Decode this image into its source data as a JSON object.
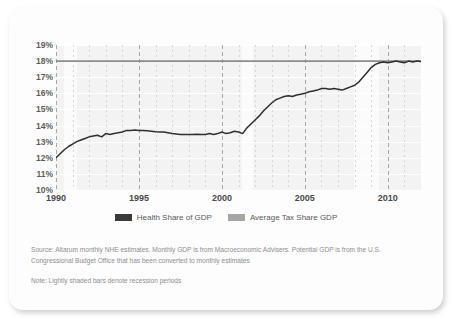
{
  "card": {
    "background": "#fdfdfd"
  },
  "legend": {
    "position": "bottom-center",
    "entries": [
      {
        "label": "Health Share of GDP",
        "color": "#3a3a3a"
      },
      {
        "label": "Average Tax Share GDP",
        "color": "#a6a6a6"
      }
    ]
  },
  "footnotes": {
    "source": "Source: Altarum monthly NHE estimates. Monthly GDP is from Macroeconomic Advisers. Potential GDP is from the U.S. Congressional Budget Office that has been converted to monthly estimates",
    "note": "Note: Lightly shaded bars denote recession periods"
  },
  "chart_data": {
    "type": "line",
    "title": "",
    "xlabel": "",
    "ylabel": "",
    "xlim": [
      1990,
      2012
    ],
    "ylim": [
      10,
      19
    ],
    "grid": true,
    "ytick_labels": [
      "19%",
      "18%",
      "17%",
      "16%",
      "15%",
      "14%",
      "13%",
      "12%",
      "11%",
      "10%"
    ],
    "ytick_values": [
      19,
      18,
      17,
      16,
      15,
      14,
      13,
      12,
      11,
      10
    ],
    "xtick_labels": [
      "1990",
      "1995",
      "2000",
      "2005",
      "2010"
    ],
    "xtick_values": [
      1990,
      1995,
      2000,
      2005,
      2010
    ],
    "annotations": [
      {
        "kind": "recession-band",
        "label": "recession period",
        "x_start": 1990.5,
        "x_end": 1991.25
      },
      {
        "kind": "recession-band",
        "label": "recession period",
        "x_start": 2001.2,
        "x_end": 2001.9
      },
      {
        "kind": "recession-band",
        "label": "recession period",
        "x_start": 2007.95,
        "x_end": 2009.45
      }
    ],
    "series": [
      {
        "name": "Health Share of GDP",
        "color": "#2f2f2f",
        "x": [
          1990.0,
          1990.25,
          1990.5,
          1990.75,
          1991.0,
          1991.25,
          1991.5,
          1991.75,
          1992.0,
          1992.25,
          1992.5,
          1992.75,
          1993.0,
          1993.25,
          1993.5,
          1993.75,
          1994.0,
          1994.25,
          1994.5,
          1994.75,
          1995.0,
          1995.25,
          1995.5,
          1995.75,
          1996.0,
          1996.25,
          1996.5,
          1996.75,
          1997.0,
          1997.25,
          1997.5,
          1997.75,
          1998.0,
          1998.25,
          1998.5,
          1998.75,
          1999.0,
          1999.25,
          1999.5,
          1999.75,
          2000.0,
          2000.25,
          2000.5,
          2000.75,
          2001.0,
          2001.25,
          2001.5,
          2001.75,
          2002.0,
          2002.25,
          2002.5,
          2002.75,
          2003.0,
          2003.25,
          2003.5,
          2003.75,
          2004.0,
          2004.25,
          2004.5,
          2004.75,
          2005.0,
          2005.25,
          2005.5,
          2005.75,
          2006.0,
          2006.25,
          2006.5,
          2006.75,
          2007.0,
          2007.25,
          2007.5,
          2007.75,
          2008.0,
          2008.25,
          2008.5,
          2008.75,
          2009.0,
          2009.25,
          2009.5,
          2009.75,
          2010.0,
          2010.25,
          2010.5,
          2010.75,
          2011.0,
          2011.25,
          2011.5,
          2011.75,
          2012.0
        ],
        "y": [
          12.0,
          12.25,
          12.5,
          12.7,
          12.85,
          13.0,
          13.1,
          13.2,
          13.3,
          13.35,
          13.4,
          13.3,
          13.5,
          13.45,
          13.5,
          13.55,
          13.6,
          13.7,
          13.7,
          13.72,
          13.7,
          13.7,
          13.68,
          13.65,
          13.62,
          13.6,
          13.6,
          13.55,
          13.5,
          13.48,
          13.45,
          13.45,
          13.45,
          13.45,
          13.46,
          13.45,
          13.45,
          13.5,
          13.45,
          13.5,
          13.6,
          13.5,
          13.55,
          13.65,
          13.6,
          13.5,
          13.85,
          14.1,
          14.35,
          14.6,
          14.9,
          15.15,
          15.4,
          15.6,
          15.7,
          15.8,
          15.85,
          15.8,
          15.9,
          15.95,
          16.0,
          16.1,
          16.15,
          16.2,
          16.3,
          16.3,
          16.25,
          16.3,
          16.25,
          16.2,
          16.3,
          16.4,
          16.5,
          16.7,
          17.0,
          17.3,
          17.6,
          17.8,
          17.9,
          17.95,
          17.9,
          17.95,
          18.0,
          17.95,
          17.9,
          18.0,
          17.95,
          18.0,
          17.98
        ]
      },
      {
        "name": "Average Tax Share GDP",
        "color": "#8c8c8c",
        "constant_value": 18.0,
        "x": [
          1990.0,
          2012.0
        ],
        "y": [
          18.0,
          18.0
        ]
      }
    ]
  }
}
